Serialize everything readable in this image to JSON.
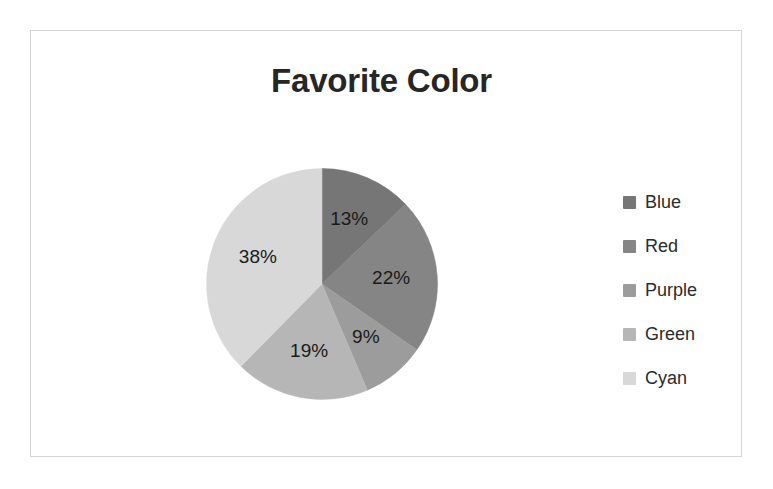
{
  "chart_data": {
    "type": "pie",
    "title": "Favorite Color",
    "xlabel": "",
    "ylabel": "",
    "legend_position": "right",
    "grid": false,
    "start_angle_clock": 12,
    "direction": "clockwise",
    "categories": [
      "Blue",
      "Red",
      "Purple",
      "Green",
      "Cyan"
    ],
    "values": [
      13,
      22,
      9,
      19,
      38
    ],
    "value_unit": "%",
    "data_labels": [
      "13%",
      "22%",
      "9%",
      "19%",
      "38%"
    ],
    "slice_colors": [
      "#767676",
      "#858585",
      "#9c9c9c",
      "#b6b6b6",
      "#d8d8d8"
    ],
    "legend": [
      {
        "label": "Blue",
        "color": "#767676",
        "value": 13,
        "data_label": "13%"
      },
      {
        "label": "Red",
        "color": "#858585",
        "value": 22,
        "data_label": "22%"
      },
      {
        "label": "Purple",
        "color": "#9c9c9c",
        "value": 9,
        "data_label": "9%"
      },
      {
        "label": "Green",
        "color": "#b6b6b6",
        "value": 19,
        "data_label": "19%"
      },
      {
        "label": "Cyan",
        "color": "#d8d8d8",
        "value": 38,
        "data_label": "38%"
      }
    ]
  },
  "frame": {
    "border_color": "#d4d4d4",
    "background": "#ffffff"
  },
  "title": {
    "text": "Favorite Color",
    "color": "#262626"
  }
}
